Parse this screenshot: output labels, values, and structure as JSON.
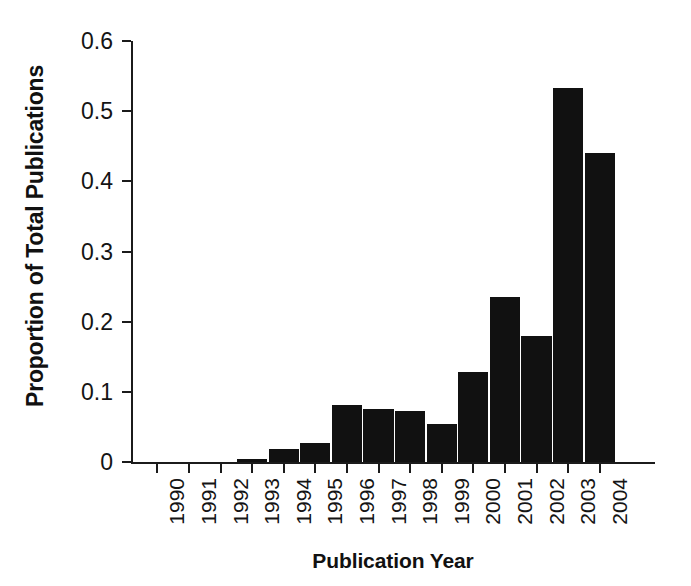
{
  "chart_data": {
    "type": "bar",
    "title": "",
    "xlabel": "Publication Year",
    "ylabel": "Proportion of Total Publications",
    "categories": [
      "1990",
      "1991",
      "1992",
      "1993",
      "1994",
      "1995",
      "1996",
      "1997",
      "1998",
      "1999",
      "2000",
      "2001",
      "2002",
      "2003",
      "2004"
    ],
    "values": [
      0,
      0,
      0,
      0.004,
      0.019,
      0.027,
      0.081,
      0.076,
      0.073,
      0.054,
      0.128,
      0.235,
      0.179,
      0.533,
      0.441
    ],
    "ylim": [
      0,
      0.6
    ],
    "ytick_labels": [
      "0",
      "0.1",
      "0.2",
      "0.3",
      "0.4",
      "0.5",
      "0.6"
    ],
    "ytick_values": [
      0,
      0.1,
      0.2,
      0.3,
      0.4,
      0.5,
      0.6
    ],
    "grid": false,
    "legend": false,
    "bar_color": "#111111",
    "axis_color": "#1b1b1b",
    "background_color": "#ffffff",
    "xtick_label_rotation": 90
  }
}
